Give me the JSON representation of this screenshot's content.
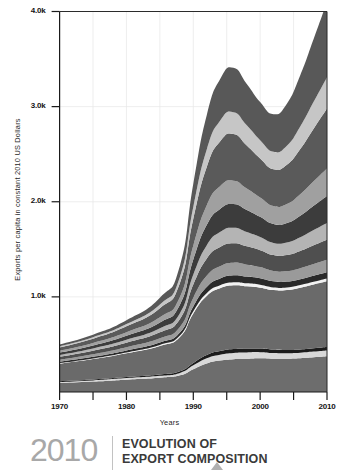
{
  "footer": {
    "year": "2010",
    "title_line1": "EVOLUTION OF",
    "title_line2": "EXPORT COMPOSITION",
    "marker_icon": "triangle-up-icon"
  },
  "chart_data": {
    "type": "area",
    "title": "",
    "subtitle": "",
    "xlabel": "Years",
    "ylabel": "Exports per capita in constant 2010 US Dollars",
    "xlim": [
      1970,
      2010
    ],
    "ylim": [
      0,
      4000
    ],
    "grid": true,
    "legend_position": "none",
    "stacked": true,
    "xticks": [
      1970,
      1980,
      1990,
      2000,
      2010
    ],
    "xtick_labels": [
      "1970",
      "1980",
      "1990",
      "2000",
      "2010"
    ],
    "xminor_ticks": [
      1975,
      1985,
      1995,
      2005
    ],
    "yticks": [
      1000,
      2000,
      3000,
      4000
    ],
    "ytick_labels": [
      "1.0k",
      "2.0k",
      "3.0k",
      "4.0k"
    ],
    "x": [
      1970,
      1975,
      1980,
      1985,
      1988,
      1990,
      1992,
      1994,
      1996,
      1998,
      2000,
      2002,
      2004,
      2006,
      2008,
      2010
    ],
    "series": [
      {
        "name": "layer-01",
        "color": "#6d6d6d",
        "values": [
          95,
          110,
          130,
          150,
          175,
          240,
          300,
          330,
          345,
          350,
          355,
          350,
          350,
          355,
          365,
          375
        ]
      },
      {
        "name": "layer-02",
        "color": "#d8d8d8",
        "values": [
          10,
          12,
          16,
          20,
          26,
          40,
          55,
          62,
          66,
          66,
          64,
          60,
          58,
          58,
          60,
          62
        ]
      },
      {
        "name": "layer-03",
        "color": "#1c1c1c",
        "values": [
          8,
          9,
          11,
          14,
          18,
          26,
          34,
          38,
          40,
          40,
          38,
          36,
          34,
          34,
          35,
          36
        ]
      },
      {
        "name": "layer-04",
        "color": "#6a6a6a",
        "values": [
          185,
          215,
          250,
          300,
          360,
          520,
          620,
          660,
          670,
          655,
          640,
          625,
          630,
          650,
          670,
          690
        ]
      },
      {
        "name": "layer-05",
        "color": "#f2f2f2",
        "values": [
          6,
          7,
          9,
          11,
          14,
          22,
          28,
          31,
          32,
          31,
          30,
          28,
          27,
          27,
          28,
          29
        ]
      },
      {
        "name": "layer-06",
        "color": "#2a2a2a",
        "values": [
          14,
          17,
          21,
          26,
          33,
          52,
          66,
          72,
          74,
          71,
          68,
          64,
          62,
          62,
          64,
          66
        ]
      },
      {
        "name": "layer-07",
        "color": "#9a9a9a",
        "values": [
          22,
          27,
          34,
          44,
          58,
          92,
          118,
          130,
          133,
          126,
          118,
          110,
          110,
          116,
          124,
          132
        ]
      },
      {
        "name": "layer-08",
        "color": "#4f4f4f",
        "values": [
          30,
          37,
          47,
          62,
          84,
          138,
          180,
          200,
          204,
          192,
          178,
          166,
          168,
          180,
          196,
          210
        ]
      },
      {
        "name": "layer-09",
        "color": "#b4b4b4",
        "values": [
          18,
          23,
          30,
          42,
          60,
          104,
          140,
          158,
          162,
          150,
          138,
          128,
          132,
          144,
          160,
          176
        ]
      },
      {
        "name": "layer-10",
        "color": "#3c3c3c",
        "values": [
          26,
          33,
          44,
          62,
          90,
          158,
          214,
          244,
          250,
          232,
          212,
          198,
          206,
          228,
          256,
          284
        ]
      },
      {
        "name": "layer-11",
        "color": "#a0a0a0",
        "values": [
          20,
          26,
          36,
          54,
          80,
          148,
          206,
          238,
          246,
          226,
          204,
          190,
          200,
          226,
          258,
          290
        ]
      },
      {
        "name": "layer-12",
        "color": "#5a5a5a",
        "values": [
          34,
          44,
          62,
          96,
          148,
          282,
          402,
          470,
          490,
          452,
          410,
          386,
          412,
          474,
          552,
          630
        ]
      },
      {
        "name": "layer-13",
        "color": "#c6c6c6",
        "values": [
          12,
          16,
          24,
          40,
          64,
          126,
          184,
          218,
          230,
          212,
          192,
          184,
          200,
          236,
          282,
          330
        ]
      },
      {
        "name": "layer-14",
        "color": "#585858",
        "values": [
          20,
          27,
          40,
          70,
          116,
          240,
          360,
          436,
          466,
          436,
          402,
          396,
          442,
          540,
          662,
          790
        ]
      }
    ],
    "total_top_values": [
      500,
      603,
      754,
      991,
      1326,
      2188,
      2907,
      3287,
      3408,
      3239,
      3049,
      2921,
      3031,
      3330,
      3712,
      4100
    ]
  }
}
